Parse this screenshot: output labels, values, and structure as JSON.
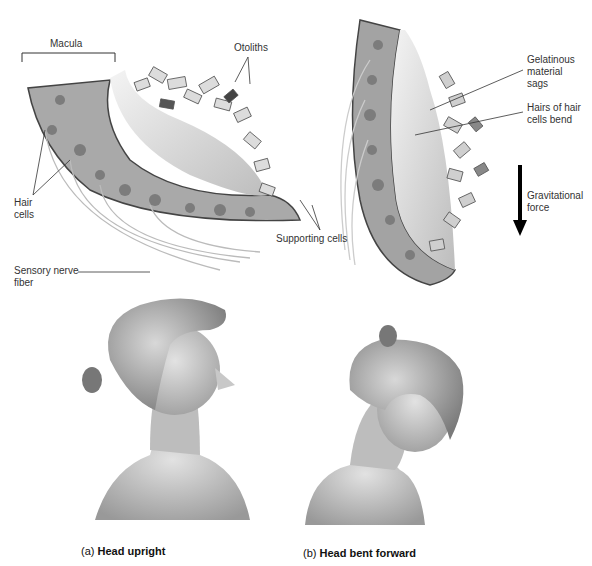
{
  "figure": {
    "panel_top_left": {
      "labels": {
        "macula": "Macula",
        "otoliths": "Otoliths",
        "hair_cells": "Hair\ncells",
        "supporting_cells": "Supporting cells",
        "sensory_nerve_fiber": "Sensory nerve\nfiber"
      }
    },
    "panel_top_right": {
      "labels": {
        "gelatinous": "Gelatinous\nmaterial\nsags",
        "hairs_bend": "Hairs of hair\ncells bend",
        "gravitational_force": "Gravitational\nforce"
      }
    },
    "captions": {
      "a_prefix": "(a)",
      "a_text": "Head upright",
      "b_prefix": "(b)",
      "b_text": "Head bent forward"
    },
    "colors": {
      "tissue_dark": "#555555",
      "tissue_mid": "#9a9a9a",
      "tissue_light": "#d6d6d6",
      "gel": "#ececec",
      "arrow": "#000000"
    }
  }
}
